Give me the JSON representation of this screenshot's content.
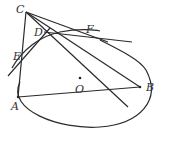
{
  "diagram": {
    "type": "geometry",
    "points": {
      "A": {
        "label": "A",
        "x": 18,
        "y": 97
      },
      "B": {
        "label": "B",
        "x": 140,
        "y": 87
      },
      "C": {
        "label": "C",
        "x": 26,
        "y": 12
      },
      "D": {
        "label": "D",
        "x": 47,
        "y": 32
      },
      "E": {
        "label": "E",
        "x": 20,
        "y": 56
      },
      "F": {
        "label": "F",
        "x": 79,
        "y": 34
      },
      "O": {
        "label": "O",
        "x": 80,
        "y": 78
      }
    },
    "labels": {
      "A": "A",
      "B": "B",
      "C": "C",
      "D": "D",
      "E": "E",
      "F": "F",
      "O": "O"
    },
    "segments": [
      "CA",
      "CB",
      "CF",
      "AB",
      "C-bottom",
      "tangent-E",
      "tangent-DF"
    ],
    "curves": [
      "ellipse",
      "arc-E-D-F"
    ],
    "caption": ""
  }
}
